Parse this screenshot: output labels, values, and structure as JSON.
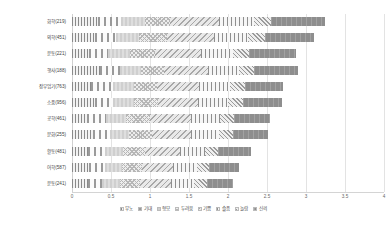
{
  "chart_data": {
    "type": "bar",
    "orientation": "horizontal",
    "stacked": true,
    "title": "",
    "xlabel": "",
    "ylabel": "",
    "xlim": [
      0,
      4
    ],
    "xticks": [
      "0",
      "0.5",
      "1",
      "1.5",
      "2",
      "2.5",
      "3",
      "3.5",
      "4"
    ],
    "grid": true,
    "legend_position": "bottom",
    "categories": [
      "화학(219)",
      "의학(451)",
      "운동(221)",
      "행사(188)",
      "장부업기(763)",
      "소품(956)",
      "공학(461)",
      "문화(255)",
      "활동(481)",
      "어학(587)",
      "운동(241)"
    ],
    "series": [
      {
        "name": "무노",
        "values": [
          0.33,
          0.3,
          0.22,
          0.36,
          0.25,
          0.3,
          0.19,
          0.27,
          0.2,
          0.22,
          0.2
        ]
      },
      {
        "name": "기대",
        "values": [
          0.3,
          0.26,
          0.24,
          0.26,
          0.28,
          0.22,
          0.24,
          0.22,
          0.22,
          0.2,
          0.19
        ]
      },
      {
        "name": "형모",
        "values": [
          0.3,
          0.3,
          0.28,
          0.26,
          0.26,
          0.28,
          0.26,
          0.24,
          0.24,
          0.22,
          0.22
        ]
      },
      {
        "name": "두려움",
        "values": [
          0.33,
          0.36,
          0.33,
          0.3,
          0.3,
          0.3,
          0.31,
          0.3,
          0.28,
          0.26,
          0.26
        ]
      },
      {
        "name": "기쁨",
        "values": [
          0.62,
          0.6,
          0.58,
          0.56,
          0.54,
          0.52,
          0.52,
          0.5,
          0.44,
          0.4,
          0.4
        ]
      },
      {
        "name": "슬픔",
        "values": [
          0.46,
          0.44,
          0.42,
          0.4,
          0.4,
          0.38,
          0.38,
          0.36,
          0.32,
          0.3,
          0.3
        ]
      },
      {
        "name": "놀람",
        "values": [
          0.21,
          0.21,
          0.2,
          0.2,
          0.19,
          0.19,
          0.18,
          0.18,
          0.17,
          0.16,
          0.16
        ]
      },
      {
        "name": "신뢰",
        "values": [
          0.7,
          0.63,
          0.6,
          0.56,
          0.48,
          0.5,
          0.46,
          0.44,
          0.42,
          0.38,
          0.34
        ]
      }
    ],
    "totals": [
      3.25,
      3.1,
      2.87,
      2.9,
      2.7,
      2.69,
      2.54,
      2.51,
      2.29,
      2.14,
      2.07
    ]
  },
  "legend": {
    "items": [
      {
        "label": "무노",
        "color": "#f2f2f2"
      },
      {
        "label": "기대",
        "color": "#fbfbfb"
      },
      {
        "label": "형모",
        "color": "#d8d8d8"
      },
      {
        "label": "두려움",
        "color": "#ededed"
      },
      {
        "label": "기쁨",
        "color": "#e9e9e9"
      },
      {
        "label": "슬픔",
        "color": "#f6f6f6"
      },
      {
        "label": "놀람",
        "color": "#efefef"
      },
      {
        "label": "신뢰",
        "color": "#8e8e8e"
      }
    ]
  }
}
